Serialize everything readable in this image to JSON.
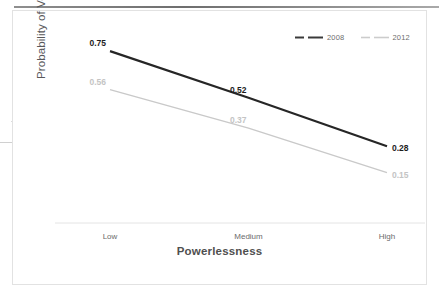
{
  "chart_data": {
    "type": "line",
    "title": "",
    "xlabel": "Powerlessness",
    "ylabel": "Probability of Voting",
    "categories": [
      "Low",
      "Medium",
      "High"
    ],
    "ylim": [
      0.0,
      0.8
    ],
    "grid": false,
    "legend_position": "top-right",
    "series": [
      {
        "name": "2008",
        "color": "#262626",
        "values": [
          0.75,
          0.52,
          0.28
        ],
        "labels": [
          "0.75",
          "0.52",
          "0.28"
        ]
      },
      {
        "name": "2012",
        "color": "#c9c9c9",
        "values": [
          0.56,
          0.37,
          0.15
        ],
        "labels": [
          "0.56",
          "0.37",
          "0.15"
        ]
      }
    ]
  },
  "legend": {
    "items": [
      {
        "label": "2008",
        "color": "#3a3a3a"
      },
      {
        "label": "2012",
        "color": "#cccccc"
      }
    ]
  },
  "axis": {
    "x_title": "Powerlessness",
    "y_title": "Probability of Voting",
    "x_ticks": [
      "Low",
      "Medium",
      "High"
    ]
  },
  "colors": {
    "series_2008": "#262626",
    "series_2012": "#c9c9c9",
    "axis_line": "#e0e0e0",
    "text": "#58585a",
    "card_border": "#e2e2e2"
  }
}
